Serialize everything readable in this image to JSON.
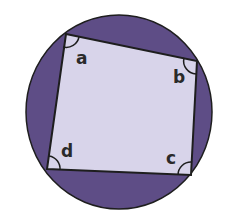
{
  "diagram": {
    "colors": {
      "background": "#ffffff",
      "circle_fill": "#5e4d86",
      "quad_fill": "#d8d4ea",
      "stroke": "#1e1e1e"
    },
    "circle": {
      "cx": 119,
      "cy": 112,
      "rx": 93,
      "ry": 97
    },
    "vertices": [
      {
        "id": "a",
        "x": 66,
        "y": 34
      },
      {
        "id": "b",
        "x": 197,
        "y": 61
      },
      {
        "id": "c",
        "x": 191,
        "y": 175
      },
      {
        "id": "d",
        "x": 47,
        "y": 169
      }
    ],
    "angle_labels": [
      {
        "text": "a",
        "x": 76,
        "y": 64
      },
      {
        "text": "b",
        "x": 173,
        "y": 83
      },
      {
        "text": "c",
        "x": 166,
        "y": 164
      },
      {
        "text": "d",
        "x": 61,
        "y": 157
      }
    ]
  }
}
